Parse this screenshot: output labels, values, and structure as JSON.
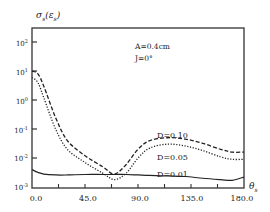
{
  "chart_data": {
    "type": "line",
    "title": "",
    "ylabel": "σs(εs)",
    "xlabel": "θs",
    "yscale": "log",
    "ylim": [
      0.001,
      500
    ],
    "xlim": [
      0,
      180
    ],
    "grid": false,
    "x_ticks": [
      0,
      22.5,
      45,
      67.5,
      90,
      112.5,
      135,
      157.5,
      180
    ],
    "x_tick_labels": [
      "0.0",
      "45.0",
      "90.0",
      "135.0",
      "180.0"
    ],
    "y_tick_labels": [
      "10^2",
      "10^1",
      "10^0",
      "10^-1",
      "10^-2",
      "10^-3"
    ],
    "annotations": [
      "A=0.4cm",
      "J=0°"
    ],
    "x": [
      0,
      5,
      10,
      20,
      30,
      45,
      60,
      70,
      80,
      90,
      100,
      115,
      130,
      145,
      160,
      170,
      180
    ],
    "series": [
      {
        "name": "D=0.10",
        "style": "dashed",
        "values": [
          10,
          8,
          3,
          0.25,
          0.04,
          0.012,
          0.005,
          0.0028,
          0.006,
          0.02,
          0.04,
          0.05,
          0.045,
          0.032,
          0.02,
          0.016,
          0.016
        ]
      },
      {
        "name": "D=0.05",
        "style": "dotted",
        "values": [
          6,
          4,
          1.2,
          0.1,
          0.02,
          0.007,
          0.003,
          0.0018,
          0.003,
          0.01,
          0.022,
          0.03,
          0.026,
          0.018,
          0.011,
          0.009,
          0.009
        ]
      },
      {
        "name": "D=0.01",
        "style": "solid",
        "values": [
          0.004,
          0.0032,
          0.0028,
          0.0026,
          0.0026,
          0.0027,
          0.0027,
          0.0027,
          0.0027,
          0.0026,
          0.0025,
          0.0024,
          0.0023,
          0.002,
          0.0018,
          0.0017,
          0.0022
        ]
      }
    ]
  },
  "labels": {
    "y_axis": "σs(εs)",
    "x_axis": "θs",
    "param_a": "A=0.4cm",
    "param_j": "J=0°",
    "d010": "D=0.10",
    "d005": "D=0.05",
    "d001": "D=0.01",
    "x0": "0.0",
    "x45": "45.0",
    "x90": "90.0",
    "x135": "135.0",
    "x180": "180.0"
  }
}
